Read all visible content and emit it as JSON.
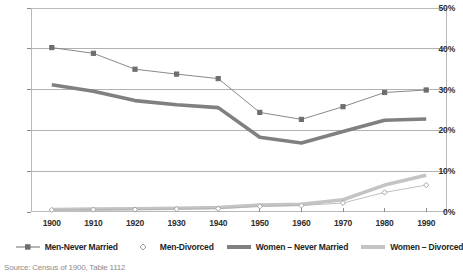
{
  "chart_data": {
    "type": "line",
    "title": "",
    "xlabel": "",
    "ylabel": "",
    "x": [
      1900,
      1910,
      1920,
      1930,
      1940,
      1950,
      1960,
      1970,
      1980,
      1990
    ],
    "xtick_labels": [
      "1900",
      "1910",
      "1920",
      "1930",
      "1940",
      "1950",
      "1960",
      "1970",
      "1980",
      "1990"
    ],
    "ytick_labels": [
      "0%",
      "10%",
      "20%",
      "30%",
      "40%",
      "50%"
    ],
    "ytick_values": [
      0,
      10,
      20,
      30,
      40,
      50
    ],
    "ylim": [
      0,
      50
    ],
    "grid": true,
    "legend_position": "bottom",
    "series": [
      {
        "name": "Men-Never Married",
        "style": "thin-line-square-marker",
        "color": "#7a7a7a",
        "values": [
          40.3,
          38.9,
          35.0,
          33.8,
          32.7,
          24.4,
          22.7,
          25.8,
          29.3,
          29.9
        ]
      },
      {
        "name": "Men-Divorced",
        "style": "marker-only-diamond",
        "color": "#b0b0b0",
        "values": [
          0.5,
          0.6,
          0.6,
          0.7,
          0.8,
          1.4,
          1.6,
          2.2,
          4.8,
          6.6
        ]
      },
      {
        "name": "Women – Never Married",
        "style": "thick-line",
        "color": "#808080",
        "values": [
          31.2,
          29.6,
          27.3,
          26.3,
          25.6,
          18.3,
          16.9,
          19.7,
          22.5,
          22.8
        ]
      },
      {
        "name": "Women – Divorced",
        "style": "thick-line-light",
        "color": "#c4c4c4",
        "values": [
          0.6,
          0.7,
          0.8,
          0.9,
          1.1,
          1.7,
          1.9,
          3.0,
          6.6,
          9.0
        ]
      }
    ]
  },
  "legend": {
    "items": [
      {
        "label": "Men-Never Married",
        "key": "thin-line-square-marker"
      },
      {
        "label": "Men-Divorced",
        "key": "diamond-marker"
      },
      {
        "label": "Women – Never Married",
        "key": "thick-bar-dark"
      },
      {
        "label": "Women – Divorced",
        "key": "thick-bar-light"
      }
    ]
  },
  "footer": {
    "source": "Source: Census of 1900, Table 1112"
  }
}
